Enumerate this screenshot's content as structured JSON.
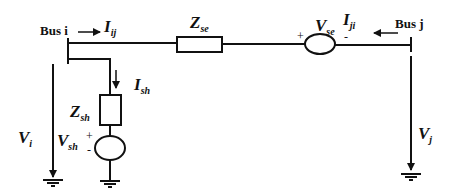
{
  "diagram": {
    "type": "circuit",
    "colors": {
      "line": "#111111",
      "background": "#ffffff"
    },
    "buses": [
      {
        "id": "bus_i",
        "label": "Bus i"
      },
      {
        "id": "bus_j",
        "label": "Bus j"
      }
    ],
    "currents": {
      "i_ij": {
        "main": "I",
        "sub": "ij"
      },
      "i_ji": {
        "main": "I",
        "sub": "ji"
      },
      "i_sh": {
        "main": "I",
        "sub": "sh"
      }
    },
    "impedances": {
      "z_se": {
        "main": "Z",
        "sub": "se"
      },
      "z_sh": {
        "main": "Z",
        "sub": "sh"
      }
    },
    "sources": {
      "v_se": {
        "main": "V",
        "sub": "se",
        "plus": "+",
        "minus": "-"
      },
      "v_sh": {
        "main": "V",
        "sub": "sh",
        "plus": "+",
        "minus": "-"
      }
    },
    "voltages": {
      "v_i": {
        "main": "V",
        "sub": "i"
      },
      "v_j": {
        "main": "V",
        "sub": "j"
      }
    }
  }
}
